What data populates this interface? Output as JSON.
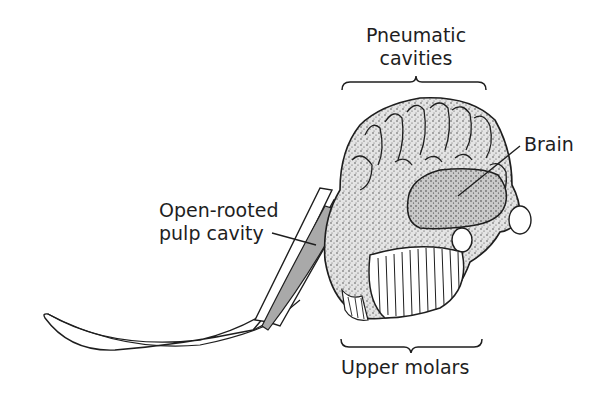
{
  "diagram": {
    "labels": {
      "pneumatic_line1": "Pneumatic",
      "pneumatic_line2": "cavities",
      "brain": "Brain",
      "pulp_line1": "Open-rooted",
      "pulp_line2": "pulp cavity",
      "molars": "Upper molars"
    },
    "colors": {
      "ink": "#1e1e1e",
      "pulp_fill": "#a9a9a9",
      "stipple_fill": "#d6d6d6",
      "brain_fill": "#bdbdbd",
      "background": "#ffffff"
    }
  }
}
